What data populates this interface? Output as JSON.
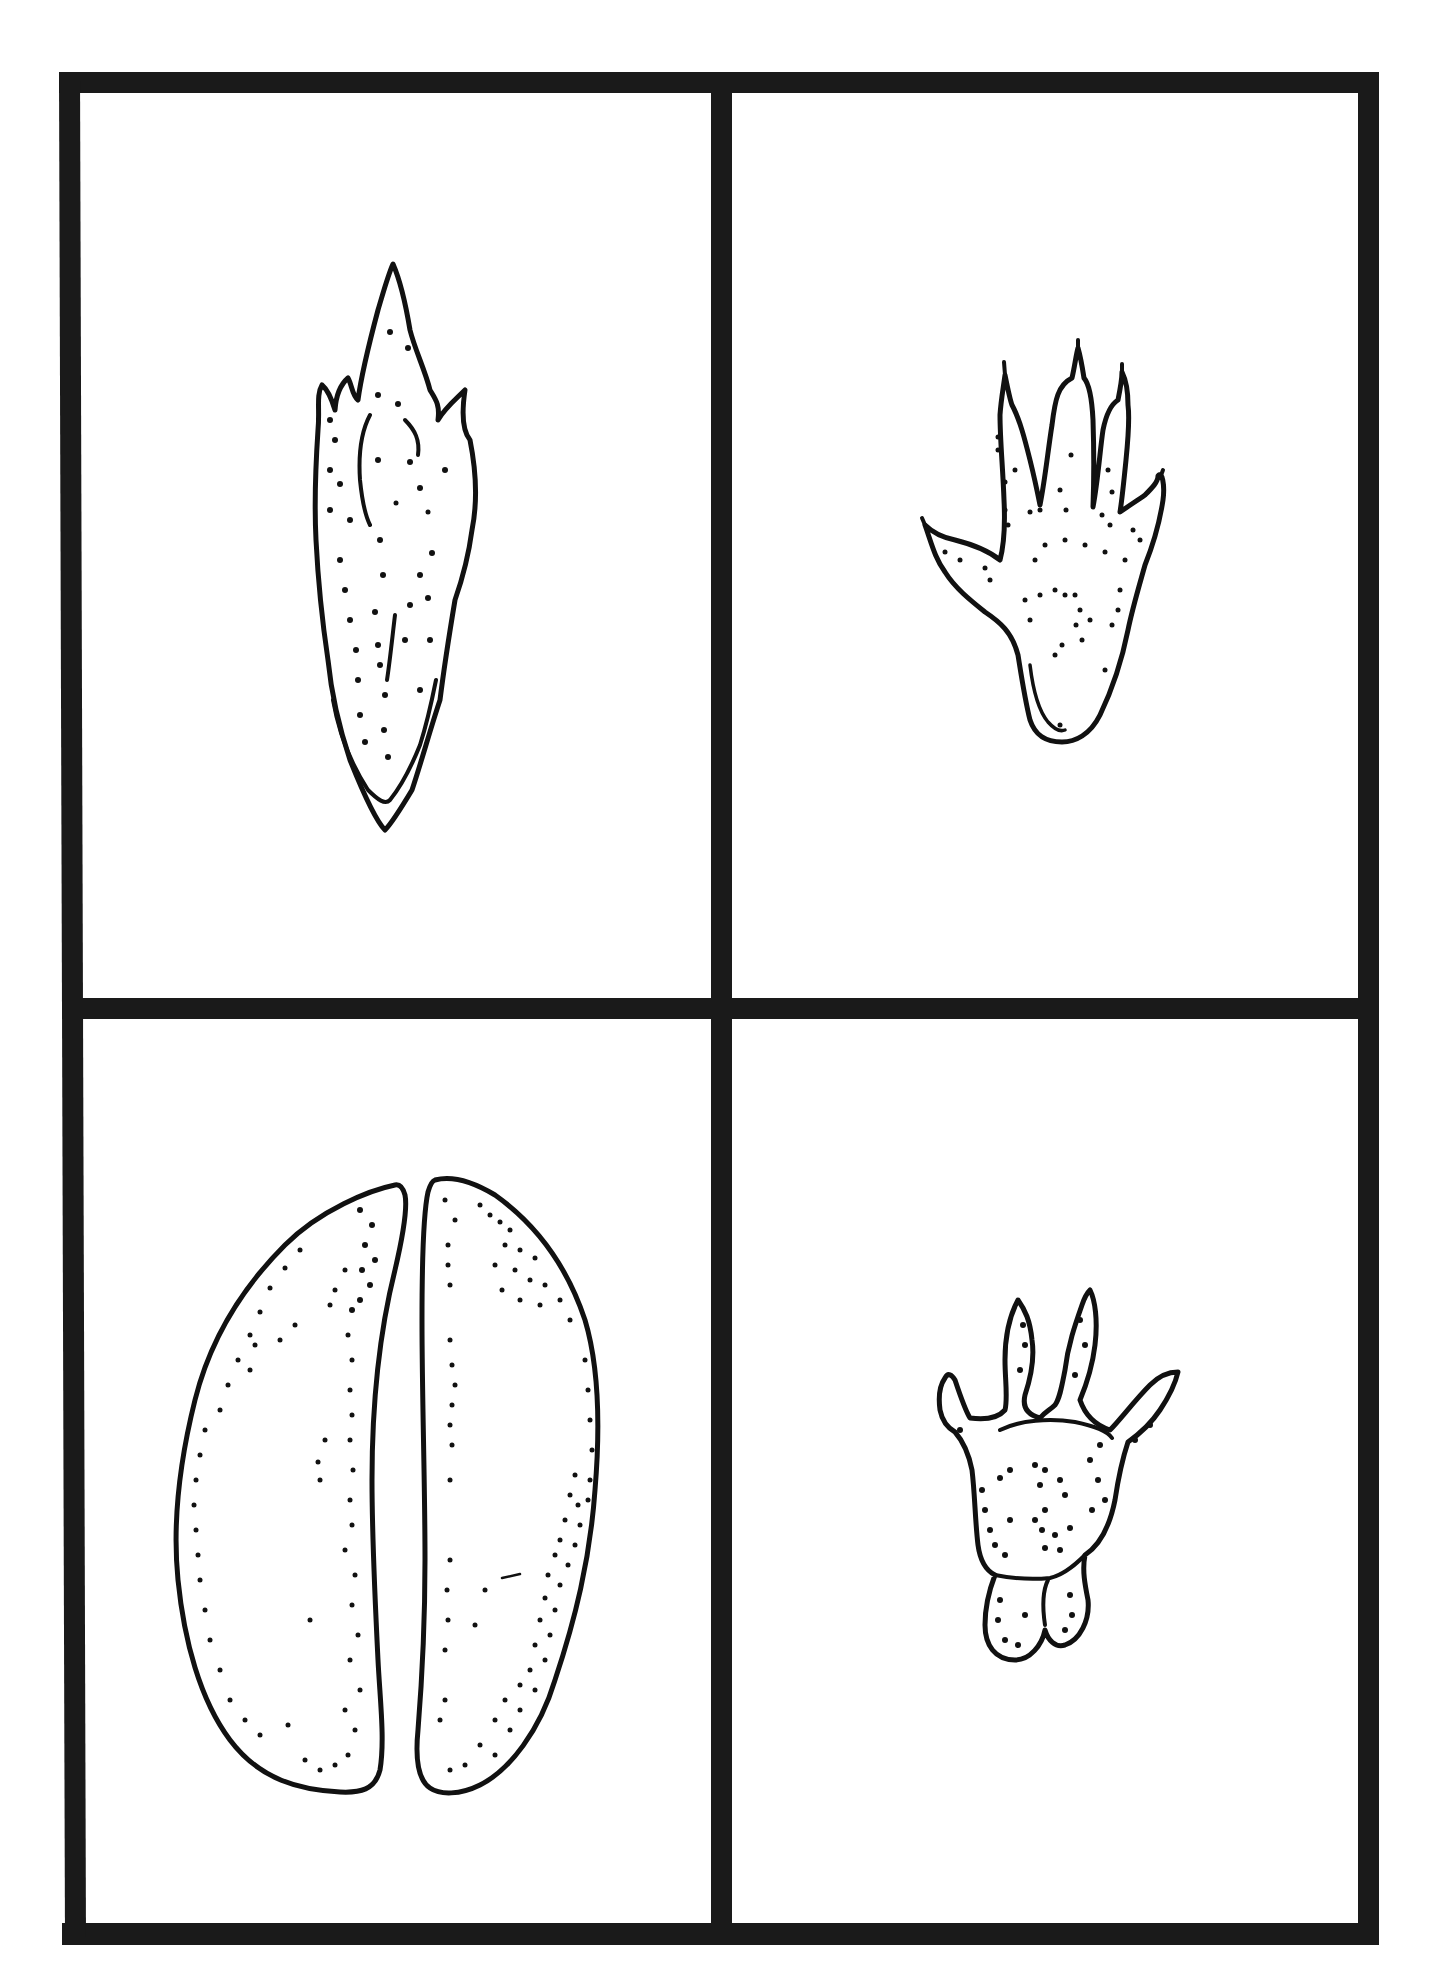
{
  "figure": {
    "layout": "2x2 grid of animal track illustrations",
    "colors": {
      "ink": "#111111",
      "frame": "#1a1a1a",
      "background": "#ffffff"
    },
    "panels": [
      {
        "position": "top-left",
        "subject": "elongated pointed track (bird/lizard-like claw)"
      },
      {
        "position": "top-right",
        "subject": "five-toed clawed hind paw print"
      },
      {
        "position": "bottom-left",
        "subject": "cloven hoof print (two halves)"
      },
      {
        "position": "bottom-right",
        "subject": "four-toed clawed paw print with heel pads"
      }
    ]
  }
}
